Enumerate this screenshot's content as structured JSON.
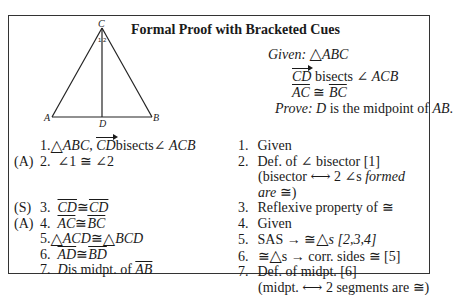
{
  "title": "Formal Proof with Bracketed Cues",
  "figure": {
    "vertices": {
      "C": "C",
      "A": "A",
      "B": "B",
      "D": "D"
    },
    "angle_labels": [
      "1",
      "2"
    ]
  },
  "given_prove": {
    "given_label": "Given:",
    "given_1": "ABC",
    "given_2_vec": "CD",
    "given_2_text": " bisects ",
    "given_2_angle": "ACB",
    "given_3_a": "AC",
    "given_3_cong": " ≅ ",
    "given_3_b": "BC",
    "prove_label": "Prove:",
    "prove_var": "D",
    "prove_text": " is the midpoint of ",
    "prove_seg": "AB",
    "prove_end": "."
  },
  "statements": [
    {
      "cue": "",
      "num": "1.",
      "parts": {
        "tri": "ABC",
        "sep": ", ",
        "vec": "CD",
        "text": " bisects ",
        "angle": "ACB"
      }
    },
    {
      "cue": "(A)",
      "num": "2.",
      "text": "∠1 ≅ ∠2"
    },
    {
      "cue": "(S)",
      "num": "3.",
      "a": "CD",
      "cong": " ≅ ",
      "b": "CD"
    },
    {
      "cue": "(A)",
      "num": "4.",
      "a": "AC",
      "cong": " ≅ ",
      "b": "BC"
    },
    {
      "cue": "",
      "num": "5.",
      "a": "ACD",
      "cong": " ≅",
      "b": "BCD"
    },
    {
      "cue": "",
      "num": "6.",
      "a": "AD",
      "cong": " ≅ ",
      "b": "BD"
    },
    {
      "cue": "",
      "num": "7.",
      "var": "D",
      "text": " is midpt. of ",
      "seg": "AB"
    }
  ],
  "reasons": [
    {
      "num": "1.",
      "text": "Given"
    },
    {
      "num": "2.",
      "text": "Def. of ∠ bisector [1]",
      "sub1": "(bisector ⟷ 2 ∠s ",
      "sub1_it": "formed",
      "sub2_it": "are",
      "sub2": " ≅)"
    },
    {
      "num": "3.",
      "text": "Reflexive property of ≅"
    },
    {
      "num": "4.",
      "text": "Given"
    },
    {
      "num": "5.",
      "pre": "SAS → ≅",
      "post": "s [2,3,4]"
    },
    {
      "num": "6.",
      "pre": "≅",
      "post": "s → corr. sides ≅ [5]"
    },
    {
      "num": "7.",
      "text": "Def. of midpt. [6]",
      "sub1": "(midpt. ⟷ 2 segments are ≅)"
    }
  ],
  "symbols": {
    "triangle": "△",
    "angle": "∠"
  }
}
